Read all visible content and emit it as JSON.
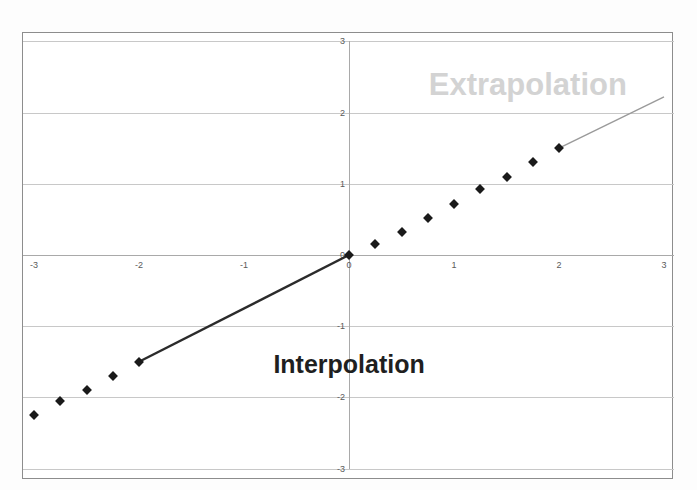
{
  "figure": {
    "clipped_caption_above": "",
    "background_color": "#fdfdfd",
    "frame_border_color": "#8d8d8d"
  },
  "annotations": {
    "extrapolation_label": "Extrapolation",
    "extrapolation_color": "#d3d3d3",
    "interpolation_label": "Interpolation",
    "interpolation_color": "#1f1f1f"
  },
  "chart_data": {
    "type": "scatter",
    "title": "",
    "xlabel": "",
    "ylabel": "",
    "xlim": [
      -3,
      3
    ],
    "ylim": [
      -3,
      3
    ],
    "xticks": [
      -3,
      -2,
      -1,
      0,
      1,
      2,
      3
    ],
    "yticks": [
      3,
      2,
      1,
      0,
      -1,
      -2,
      -3
    ],
    "xtick_labels": [
      "-3",
      "-2",
      "-1",
      "0",
      "1",
      "2",
      "3"
    ],
    "ytick_labels": [
      "3",
      "2",
      "1",
      "0",
      "-1",
      "-2",
      "-3"
    ],
    "grid": true,
    "grid_color": "#c8c8c8",
    "axis_color": "#a9a9a9",
    "legend": null,
    "marker_color": "#1a1a1a",
    "marker_shape": "diamond",
    "series": [
      {
        "name": "data points",
        "type": "scatter",
        "points": [
          {
            "x": -3.0,
            "y": -2.25
          },
          {
            "x": -2.75,
            "y": -2.05
          },
          {
            "x": -2.5,
            "y": -1.9
          },
          {
            "x": -2.25,
            "y": -1.7
          },
          {
            "x": -2.0,
            "y": -1.5
          },
          {
            "x": 0.0,
            "y": 0.0
          },
          {
            "x": 0.25,
            "y": 0.15
          },
          {
            "x": 0.5,
            "y": 0.32
          },
          {
            "x": 0.75,
            "y": 0.52
          },
          {
            "x": 1.0,
            "y": 0.72
          },
          {
            "x": 1.25,
            "y": 0.92
          },
          {
            "x": 1.5,
            "y": 1.1
          },
          {
            "x": 1.75,
            "y": 1.3
          },
          {
            "x": 2.0,
            "y": 1.5
          }
        ]
      },
      {
        "name": "interpolation segment",
        "type": "line",
        "color": "#2b2b2b",
        "width": 2.4,
        "points": [
          {
            "x": -2.0,
            "y": -1.5
          },
          {
            "x": 0.0,
            "y": 0.0
          }
        ]
      },
      {
        "name": "extrapolation segment",
        "type": "line",
        "color": "#9a9a9a",
        "width": 1.4,
        "points": [
          {
            "x": 2.0,
            "y": 1.5
          },
          {
            "x": 3.0,
            "y": 2.22
          }
        ]
      }
    ]
  }
}
